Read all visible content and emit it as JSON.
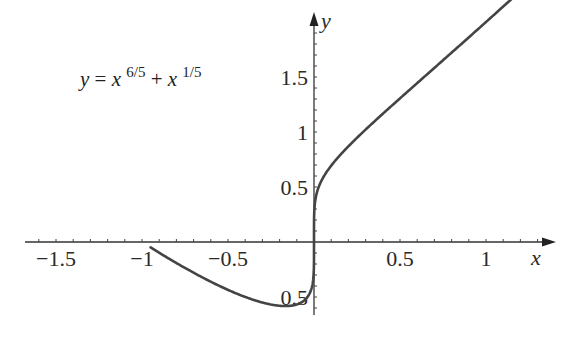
{
  "chart_data": {
    "type": "line",
    "title": "",
    "annotation": {
      "text_parts": [
        "y",
        " = ",
        "x",
        "6/5",
        " + ",
        "x",
        "1/5"
      ],
      "plain": "y = x^(6/5) + x^(1/5)"
    },
    "xlabel": "x",
    "ylabel": "y",
    "xlim": [
      -1.8,
      1.3
    ],
    "ylim": [
      -0.65,
      2.1
    ],
    "x_ticks": [
      -1.5,
      -1,
      -0.5,
      0.5,
      1
    ],
    "x_tick_labels": [
      "−1.5",
      "−1",
      "−0.5",
      "0.5",
      "1"
    ],
    "y_ticks": [
      -0.5,
      0.5,
      1,
      1.5
    ],
    "y_tick_labels": [
      "0.5",
      "0.5",
      "1",
      "1.5"
    ],
    "grid": false,
    "series": [
      {
        "name": "y = x^(6/5) + x^(1/5)",
        "x_range": [
          -0.95,
          1.2
        ],
        "x": [
          -0.95,
          -0.8,
          -0.6,
          -0.4,
          -0.2,
          -0.1,
          -0.05,
          0,
          0.05,
          0.1,
          0.25,
          0.5,
          0.75,
          1.0,
          1.2
        ],
        "y": [
          -0.05,
          -0.18,
          -0.36,
          -0.49,
          -0.58,
          -0.57,
          -0.53,
          0,
          0.57,
          0.69,
          0.95,
          1.31,
          1.65,
          2.0,
          2.28
        ]
      }
    ],
    "color": "#444444"
  },
  "layout": {
    "origin_px": [
      314,
      242
    ],
    "px_per_unit_x": 172,
    "px_per_unit_y": 110
  }
}
